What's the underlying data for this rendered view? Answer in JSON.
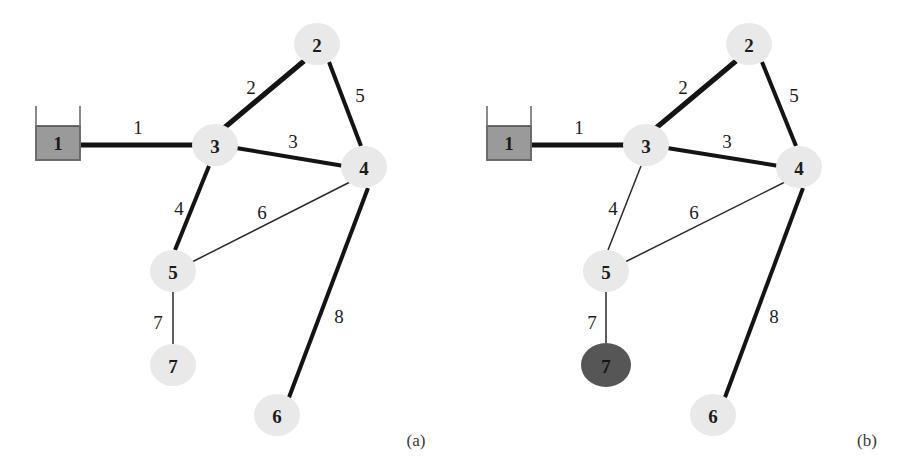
{
  "figure": {
    "background_color": "#ffffff",
    "width": 903,
    "height": 468
  },
  "colors": {
    "node_fill_light": "#e9e9e9",
    "node_fill_dark": "#565656",
    "tank_fill": "#9a9a9a",
    "edge_color": "#141414",
    "text_color": "#1c1c1c",
    "caption_color": "#3a3a3a"
  },
  "panels": [
    {
      "id": "panel-a",
      "caption": "(a)",
      "caption_x": 416,
      "caption_y": 440,
      "nodes": [
        {
          "id": "n1",
          "label": "1",
          "shape": "tank",
          "style": "light",
          "x": 58,
          "y": 142,
          "rx": 23,
          "ry": 21
        },
        {
          "id": "n2",
          "label": "2",
          "shape": "circle",
          "style": "light",
          "x": 317,
          "y": 44,
          "rx": 23,
          "ry": 21
        },
        {
          "id": "n3",
          "label": "3",
          "shape": "circle",
          "style": "light",
          "x": 215,
          "y": 145,
          "rx": 23,
          "ry": 21
        },
        {
          "id": "n4",
          "label": "4",
          "shape": "circle",
          "style": "light",
          "x": 364,
          "y": 167,
          "rx": 23,
          "ry": 21
        },
        {
          "id": "n5",
          "label": "5",
          "shape": "circle",
          "style": "light",
          "x": 173,
          "y": 271,
          "rx": 23,
          "ry": 21
        },
        {
          "id": "n6",
          "label": "6",
          "shape": "circle",
          "style": "light",
          "x": 277,
          "y": 415,
          "rx": 23,
          "ry": 21
        },
        {
          "id": "n7",
          "label": "7",
          "shape": "circle",
          "style": "light",
          "x": 173,
          "y": 365,
          "rx": 23,
          "ry": 21
        }
      ],
      "edges": [
        {
          "id": "e1",
          "label": "1",
          "from": "n1",
          "to": "n3",
          "weight": "thick",
          "x1": 81,
          "y1": 145,
          "x2": 196,
          "y2": 145,
          "lx": 138,
          "ly": 127
        },
        {
          "id": "e2",
          "label": "2",
          "from": "n3",
          "to": "n2",
          "weight": "thick",
          "x1": 224,
          "y1": 128,
          "x2": 304,
          "y2": 61,
          "lx": 251,
          "ly": 87
        },
        {
          "id": "e3",
          "label": "3",
          "from": "n3",
          "to": "n4",
          "weight": "medium",
          "x1": 236,
          "y1": 148,
          "x2": 344,
          "y2": 166,
          "lx": 293,
          "ly": 141
        },
        {
          "id": "e5",
          "label": "5",
          "from": "n2",
          "to": "n4",
          "weight": "medium",
          "x1": 329,
          "y1": 62,
          "x2": 361,
          "y2": 146,
          "lx": 360,
          "ly": 95
        },
        {
          "id": "e4",
          "label": "4",
          "from": "n3",
          "to": "n5",
          "weight": "medium",
          "x1": 209,
          "y1": 166,
          "x2": 175,
          "y2": 250,
          "lx": 179,
          "ly": 208
        },
        {
          "id": "e6",
          "label": "6",
          "from": "n5",
          "to": "n4",
          "weight": "thin",
          "x1": 190,
          "y1": 263,
          "x2": 352,
          "y2": 181,
          "lx": 262,
          "ly": 212
        },
        {
          "id": "e7",
          "label": "7",
          "from": "n5",
          "to": "n7",
          "weight": "thin",
          "x1": 173,
          "y1": 292,
          "x2": 173,
          "y2": 344,
          "lx": 158,
          "ly": 322
        },
        {
          "id": "e8",
          "label": "8",
          "from": "n4",
          "to": "n6",
          "weight": "medium",
          "x1": 368,
          "y1": 188,
          "x2": 288,
          "y2": 400,
          "lx": 339,
          "ly": 316
        }
      ]
    },
    {
      "id": "panel-b",
      "caption": "(b)",
      "caption_x": 416,
      "caption_y": 440,
      "nodes": [
        {
          "id": "n1",
          "label": "1",
          "shape": "tank",
          "style": "light",
          "x": 58,
          "y": 142,
          "rx": 23,
          "ry": 21
        },
        {
          "id": "n2",
          "label": "2",
          "shape": "circle",
          "style": "light",
          "x": 298,
          "y": 44,
          "rx": 23,
          "ry": 21
        },
        {
          "id": "n3",
          "label": "3",
          "shape": "circle",
          "style": "light",
          "x": 195,
          "y": 145,
          "rx": 23,
          "ry": 21
        },
        {
          "id": "n4",
          "label": "4",
          "shape": "circle",
          "style": "light",
          "x": 348,
          "y": 167,
          "rx": 23,
          "ry": 21
        },
        {
          "id": "n5",
          "label": "5",
          "shape": "circle",
          "style": "light",
          "x": 155,
          "y": 271,
          "rx": 23,
          "ry": 21
        },
        {
          "id": "n6",
          "label": "6",
          "shape": "circle",
          "style": "light",
          "x": 262,
          "y": 415,
          "rx": 23,
          "ry": 21
        },
        {
          "id": "n7",
          "label": "7",
          "shape": "circle",
          "style": "dark",
          "x": 155,
          "y": 365,
          "rx": 25,
          "ry": 22
        }
      ],
      "edges": [
        {
          "id": "e1",
          "label": "1",
          "from": "n1",
          "to": "n3",
          "weight": "thick",
          "x1": 81,
          "y1": 145,
          "x2": 176,
          "y2": 145,
          "lx": 128,
          "ly": 127
        },
        {
          "id": "e2",
          "label": "2",
          "from": "n3",
          "to": "n2",
          "weight": "thick",
          "x1": 205,
          "y1": 128,
          "x2": 285,
          "y2": 61,
          "lx": 232,
          "ly": 87
        },
        {
          "id": "e3",
          "label": "3",
          "from": "n3",
          "to": "n4",
          "weight": "medium",
          "x1": 216,
          "y1": 148,
          "x2": 328,
          "y2": 166,
          "lx": 276,
          "ly": 141
        },
        {
          "id": "e5",
          "label": "5",
          "from": "n2",
          "to": "n4",
          "weight": "medium",
          "x1": 311,
          "y1": 62,
          "x2": 345,
          "y2": 146,
          "lx": 343,
          "ly": 95
        },
        {
          "id": "e4",
          "label": "4",
          "from": "n3",
          "to": "n5",
          "weight": "thin",
          "x1": 190,
          "y1": 166,
          "x2": 157,
          "y2": 250,
          "lx": 162,
          "ly": 208
        },
        {
          "id": "e6",
          "label": "6",
          "from": "n5",
          "to": "n4",
          "weight": "thin",
          "x1": 172,
          "y1": 263,
          "x2": 336,
          "y2": 181,
          "lx": 243,
          "ly": 212
        },
        {
          "id": "e7",
          "label": "7",
          "from": "n5",
          "to": "n7",
          "weight": "thin",
          "x1": 155,
          "y1": 292,
          "x2": 155,
          "y2": 343,
          "lx": 141,
          "ly": 322
        },
        {
          "id": "e8",
          "label": "8",
          "from": "n4",
          "to": "n6",
          "weight": "medium",
          "x1": 352,
          "y1": 188,
          "x2": 273,
          "y2": 400,
          "lx": 323,
          "ly": 316
        }
      ]
    }
  ],
  "graph_data": {
    "type": "graph",
    "description": "Undirected weighted network with numbered nodes and numbered edges, shown twice",
    "node_ids": [
      "1",
      "2",
      "3",
      "4",
      "5",
      "6",
      "7"
    ],
    "edge_ids": [
      "1",
      "2",
      "3",
      "4",
      "5",
      "6",
      "7",
      "8"
    ],
    "edge_list": [
      {
        "edge": "1",
        "endpoints": [
          "1",
          "3"
        ]
      },
      {
        "edge": "2",
        "endpoints": [
          "3",
          "2"
        ]
      },
      {
        "edge": "3",
        "endpoints": [
          "3",
          "4"
        ]
      },
      {
        "edge": "4",
        "endpoints": [
          "3",
          "5"
        ]
      },
      {
        "edge": "5",
        "endpoints": [
          "2",
          "4"
        ]
      },
      {
        "edge": "6",
        "endpoints": [
          "5",
          "4"
        ]
      },
      {
        "edge": "7",
        "endpoints": [
          "5",
          "7"
        ]
      },
      {
        "edge": "8",
        "endpoints": [
          "4",
          "6"
        ]
      }
    ]
  }
}
